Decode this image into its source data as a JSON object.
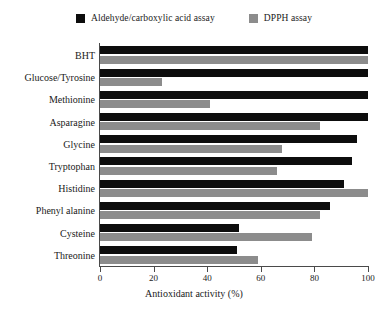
{
  "chart_data": {
    "type": "bar",
    "orientation": "horizontal",
    "title": "",
    "xlabel": "Antioxidant activity (%)",
    "ylabel": "",
    "xlim": [
      0,
      100
    ],
    "xticks": [
      "0",
      "20",
      "40",
      "60",
      "80",
      "100"
    ],
    "grid": false,
    "legend_position": "top-center",
    "categories": [
      "BHT",
      "Glucose/Tyrosine",
      "Methionine",
      "Asparagine",
      "Glycine",
      "Tryptophan",
      "Histidine",
      "Phenyl alanine",
      "Cysteine",
      "Threonine"
    ],
    "series": [
      {
        "name": "Aldehyde/carboxylic acid assay",
        "color": "#0d0d0d",
        "values": [
          100,
          100,
          100,
          100,
          96,
          94,
          91,
          86,
          52,
          51
        ]
      },
      {
        "name": "DPPH assay",
        "color": "#8c8c8c",
        "values": [
          100,
          23,
          41,
          82,
          68,
          66,
          100,
          82,
          79,
          59
        ]
      }
    ]
  },
  "legend": {
    "items": [
      {
        "label": "Aldehyde/carboxylic acid assay",
        "swatch": "legend-swatch-black"
      },
      {
        "label": "DPPH assay",
        "swatch": "legend-swatch-gray"
      }
    ]
  }
}
